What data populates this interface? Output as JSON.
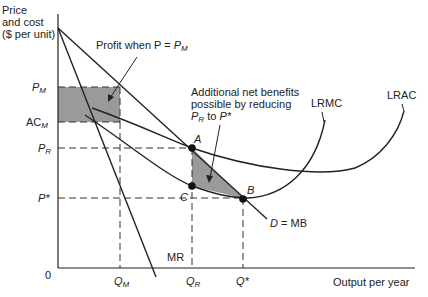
{
  "figure": {
    "y_axis_label": [
      "Price",
      "and cost",
      "($ per unit)"
    ],
    "x_axis_label": "Output per year",
    "origin_label": "0",
    "y_ticks": {
      "pm": {
        "main": "P",
        "sub": "M"
      },
      "acm": {
        "main": "AC",
        "sub": "M"
      },
      "pr": {
        "main": "P",
        "sub": "R"
      },
      "pstar": {
        "main": "P*",
        "sub": ""
      }
    },
    "x_ticks": {
      "qm": {
        "main": "Q",
        "sub": "M"
      },
      "qr": {
        "main": "Q",
        "sub": "R"
      },
      "qstar": {
        "main": "Q*",
        "sub": ""
      }
    },
    "curves": {
      "lrmc": "LRMC",
      "lrac": "LRAC",
      "mr": "MR",
      "demand": "D = MB"
    },
    "points": {
      "a": "A",
      "b": "B",
      "c": "C"
    },
    "annotations": {
      "profit": {
        "text": "Profit when P = ",
        "main": "P",
        "sub": "M"
      },
      "net_benefits": {
        "line1": "Additional net benefits",
        "line2": "possible by reducing",
        "line3_pre": "P",
        "line3_sub": "R",
        "line3_post": " to ",
        "line3_end": "P*"
      }
    },
    "colors": {
      "line": "#222222",
      "shade": "#9a9a9a",
      "dash": "#333333"
    }
  }
}
